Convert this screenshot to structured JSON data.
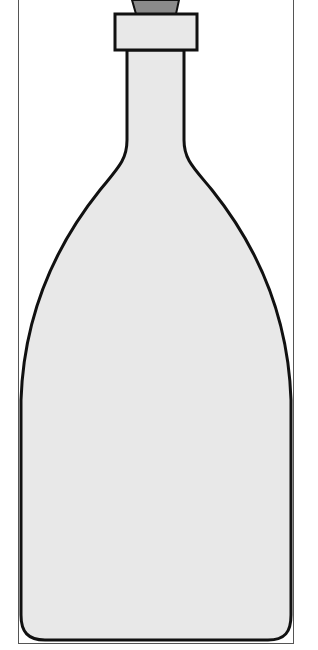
{
  "illustration": {
    "subject": "bottle",
    "colors": {
      "background": "#ffffff",
      "bottle_fill": "#e8e8e8",
      "outline": "#111111",
      "stopper_fill": "#8a8a8a",
      "frame": "#555555"
    }
  }
}
